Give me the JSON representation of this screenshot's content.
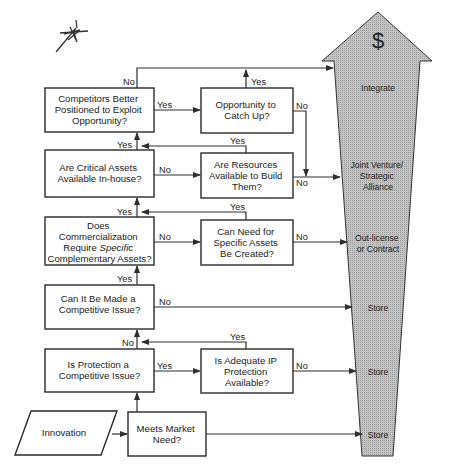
{
  "diagram": {
    "type": "flowchart",
    "start": {
      "label": "Innovation"
    },
    "decisions": {
      "market_need": {
        "lines": [
          "Meets Market",
          "Need?"
        ]
      },
      "protection": {
        "lines": [
          "Is Protection a",
          "Competitive Issue?"
        ]
      },
      "adequate_ip": {
        "lines": [
          "Is Adequate IP",
          "Protection",
          "Available?"
        ]
      },
      "make_competitive": {
        "lines": [
          "Can It Be Made a",
          "Competitive Issue?"
        ]
      },
      "requires_assets": {
        "lines": [
          "Does",
          "Commercialization",
          "Require ",
          "Specific",
          "Complementary Assets?"
        ]
      },
      "need_created": {
        "lines": [
          "Can Need for",
          "Specific Assets",
          "Be Created?"
        ]
      },
      "critical_assets": {
        "lines": [
          "Are Critical Assets",
          "Available In-house?"
        ]
      },
      "resources_build": {
        "lines": [
          "Are Resources",
          "Available to Build",
          "Them?"
        ]
      },
      "competitors_better": {
        "lines": [
          "Competitors Better",
          "Positioned to Exploit",
          "Opportunity?"
        ]
      },
      "catch_up": {
        "lines": [
          "Opportunity to",
          "Catch Up?"
        ]
      }
    },
    "edge_labels": {
      "yes": "Yes",
      "no": "No"
    },
    "outcome_arrow": {
      "symbol": "$",
      "fill_color": "#b8b8b8",
      "outcomes": [
        {
          "lines": [
            "Integrate"
          ]
        },
        {
          "lines": [
            "Joint Venture/",
            "Strategic",
            "Alliance"
          ]
        },
        {
          "lines": [
            "Out-license",
            "or Contract"
          ]
        },
        {
          "lines": [
            "Store"
          ]
        },
        {
          "lines": [
            "Store"
          ]
        },
        {
          "lines": [
            "Store"
          ]
        }
      ]
    }
  }
}
